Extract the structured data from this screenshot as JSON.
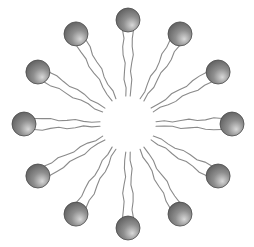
{
  "diagram": {
    "type": "micelle",
    "molecule_count": 12,
    "tails_per_molecule": 2,
    "parts": {
      "head": "hydrophilic-head",
      "tail": "hydrophobic-tail",
      "core": "hydrophobic-core"
    },
    "colors": {
      "head_light": "#d8d8d8",
      "head_mid": "#8f8f8f",
      "head_dark": "#5a5a5a",
      "head_outline": "#4a4a4a",
      "tail": "#8a8a8a",
      "background": "#ffffff"
    }
  }
}
